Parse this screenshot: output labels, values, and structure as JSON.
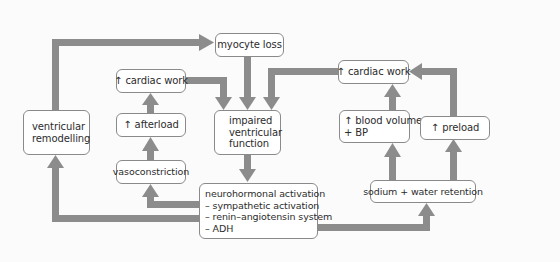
{
  "diagram": {
    "nodes": {
      "myocyte_loss": "myocyte loss",
      "cardiac_work_left": "↑ cardiac work",
      "ventricular_remodelling": [
        "ventricular",
        "remodelling"
      ],
      "afterload": "↑ afterload",
      "impaired_function": [
        "impaired",
        "ventricular",
        "function"
      ],
      "vasoconstriction": "vasoconstriction",
      "neurohormonal": [
        "neurohormonal activation",
        "– sympathetic activation",
        "– renin–angiotensin system",
        "– ADH"
      ],
      "cardiac_work_right": "↑ cardiac work",
      "blood_volume": [
        "↑ blood volume",
        "+ BP"
      ],
      "preload": "↑ preload",
      "sodium_water": "sodium + water retention"
    },
    "edges": [
      {
        "from": "ventricular_remodelling",
        "to": "myocyte_loss"
      },
      {
        "from": "myocyte_loss",
        "to": "impaired_function"
      },
      {
        "from": "cardiac_work_left",
        "to": "impaired_function"
      },
      {
        "from": "cardiac_work_right",
        "to": "impaired_function"
      },
      {
        "from": "afterload",
        "to": "cardiac_work_left"
      },
      {
        "from": "vasoconstriction",
        "to": "afterload"
      },
      {
        "from": "impaired_function",
        "to": "neurohormonal"
      },
      {
        "from": "neurohormonal",
        "to": "vasoconstriction"
      },
      {
        "from": "neurohormonal",
        "to": "ventricular_remodelling"
      },
      {
        "from": "neurohormonal",
        "to": "sodium_water"
      },
      {
        "from": "sodium_water",
        "to": "blood_volume"
      },
      {
        "from": "sodium_water",
        "to": "preload"
      },
      {
        "from": "blood_volume",
        "to": "cardiac_work_right"
      },
      {
        "from": "preload",
        "to": "cardiac_work_right"
      }
    ],
    "colors": {
      "arrow": "#8c8c8c",
      "box_border": "#8a8a8a",
      "box_fill": "#ffffff",
      "text": "#2c2c2c",
      "background": "#fbfbfb"
    }
  }
}
